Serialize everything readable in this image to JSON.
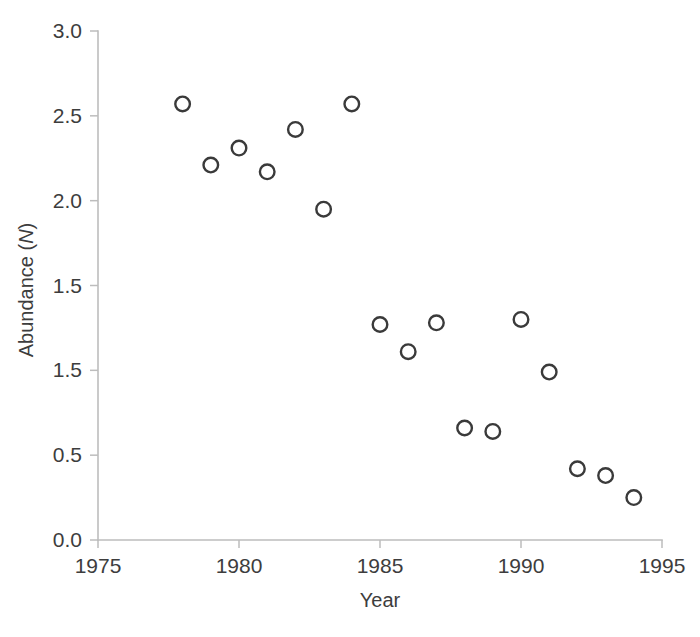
{
  "chart_data": {
    "type": "scatter",
    "title": "",
    "xlabel": "Year",
    "ylabel": "Abundance (N)",
    "ylabel_plain": "Abundance (",
    "ylabel_italic": "N",
    "ylabel_close": ")",
    "xlim": [
      1975,
      1995
    ],
    "ylim": [
      0.0,
      3.0
    ],
    "grid": false,
    "legend": null,
    "marker": "open-circle",
    "marker_color": "#3a3a3a",
    "marker_fill": "none",
    "xticks": [
      1975,
      1980,
      1985,
      1990,
      1995
    ],
    "xtick_labels": [
      "1975",
      "1980",
      "1985",
      "1990",
      "1995"
    ],
    "yticks": [
      0.0,
      0.5,
      1.0,
      1.5,
      2.0,
      2.5,
      3.0
    ],
    "ytick_labels": [
      "0.0",
      "0.5",
      "1.5",
      "1.5",
      "2.0",
      "2.5",
      "3.0"
    ],
    "x": [
      1978,
      1979,
      1980,
      1981,
      1982,
      1983,
      1984,
      1985,
      1986,
      1987,
      1988,
      1989,
      1990,
      1991,
      1992,
      1993,
      1994
    ],
    "y": [
      2.57,
      2.21,
      2.31,
      2.17,
      2.42,
      1.95,
      2.57,
      1.27,
      1.11,
      1.28,
      0.66,
      0.64,
      1.3,
      0.99,
      0.42,
      0.38,
      0.25
    ],
    "points": [
      {
        "x": 1978,
        "y": 2.57
      },
      {
        "x": 1979,
        "y": 2.21
      },
      {
        "x": 1980,
        "y": 2.31
      },
      {
        "x": 1981,
        "y": 2.17
      },
      {
        "x": 1982,
        "y": 2.42
      },
      {
        "x": 1983,
        "y": 1.95
      },
      {
        "x": 1984,
        "y": 2.57
      },
      {
        "x": 1985,
        "y": 1.27
      },
      {
        "x": 1986,
        "y": 1.11
      },
      {
        "x": 1987,
        "y": 1.28
      },
      {
        "x": 1988,
        "y": 0.66
      },
      {
        "x": 1989,
        "y": 0.64
      },
      {
        "x": 1990,
        "y": 1.3
      },
      {
        "x": 1991,
        "y": 0.99
      },
      {
        "x": 1992,
        "y": 0.42
      },
      {
        "x": 1993,
        "y": 0.38
      },
      {
        "x": 1994,
        "y": 0.25
      }
    ]
  },
  "colors": {
    "background": "#ffffff",
    "axis": "#bdbdbd",
    "text": "#3d3d3d",
    "marker": "#3a3a3a"
  }
}
